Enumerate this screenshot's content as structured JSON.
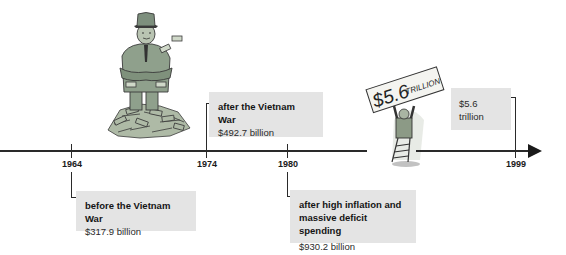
{
  "timeline": {
    "events": [
      {
        "year": "1964",
        "title": "before the Vietnam War",
        "value": "$317.9 billion"
      },
      {
        "year": "1974",
        "title": "after the Vietnam War",
        "value": "$492.7 billion"
      },
      {
        "year": "1980",
        "title": "after high inflation and massive deficit spending",
        "value": "$930.2 billion"
      },
      {
        "year": "1999",
        "title": "",
        "value": "$5.6 trillion"
      }
    ]
  },
  "illustrations": {
    "money_man": {
      "description": "cartoon official standing on a pile of money",
      "colors": {
        "suit": "#8fa08c",
        "hat": "#7d8f7d",
        "money": "#a9b7a0",
        "outline": "#3a3a3a"
      }
    },
    "sign_holder": {
      "sign_text": "$5.6 TRILLION",
      "colors": {
        "sign": "#f4f4f0",
        "figure": "#8c9a86",
        "outline": "#333333"
      }
    }
  },
  "colors": {
    "axis": "#2a2a2a",
    "box_background": "#e4e4e4",
    "text": "#1c1c1c"
  }
}
